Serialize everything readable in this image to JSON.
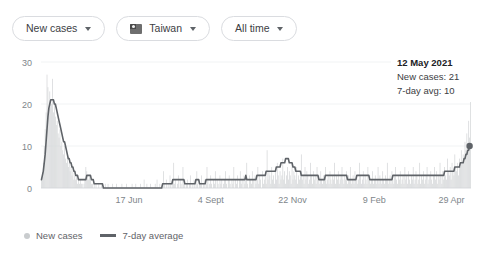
{
  "toolbar": {
    "metric_chip": {
      "label": "New cases",
      "icon": "chevron-down-icon"
    },
    "region_chip": {
      "label": "Taiwan",
      "icon": "taiwan-flag-icon",
      "caret": "chevron-down-icon"
    },
    "range_chip": {
      "label": "All time",
      "icon": "chevron-down-icon"
    }
  },
  "tooltip": {
    "date": "12 May 2021",
    "new_cases": "New cases: 21",
    "avg": "7-day avg: 10"
  },
  "legend": [
    {
      "label": "New cases",
      "marker": "dot",
      "color": "#c9ccce"
    },
    {
      "label": "7-day average",
      "marker": "line",
      "color": "#5f6368"
    }
  ],
  "colors": {
    "bars": "#d3d5d7",
    "line": "#5f6368",
    "grid": "#f1f3f4",
    "axis_text": "#80868b",
    "chip_border": "#dadce0"
  },
  "chart_data": {
    "type": "bar",
    "title": "",
    "xlabel": "",
    "ylabel": "",
    "ylim": [
      0,
      30
    ],
    "yticks": [
      0,
      10,
      20,
      30
    ],
    "grid": true,
    "legend_position": "bottom-left",
    "xticks": [
      "17 Jun",
      "4 Sept",
      "22 Nov",
      "9 Feb",
      "29 Apr"
    ],
    "xtick_positions": [
      0.205,
      0.395,
      0.585,
      0.775,
      0.955
    ],
    "series": [
      {
        "name": "New cases",
        "type": "bar",
        "values": [
          2,
          4,
          6,
          10,
          14,
          18,
          27,
          24,
          19,
          23,
          21,
          20,
          26,
          18,
          20,
          17,
          15,
          16,
          13,
          12,
          14,
          10,
          11,
          9,
          8,
          10,
          7,
          6,
          8,
          5,
          6,
          4,
          5,
          3,
          4,
          2,
          3,
          2,
          3,
          1,
          2,
          1,
          2,
          1,
          1,
          0,
          1,
          2,
          5,
          4,
          3,
          2,
          3,
          2,
          1,
          1,
          0,
          1,
          0,
          1,
          0,
          0,
          1,
          0,
          0,
          1,
          0,
          0,
          0,
          1,
          0,
          0,
          1,
          0,
          0,
          0,
          0,
          1,
          0,
          0,
          0,
          1,
          0,
          0,
          0,
          0,
          0,
          1,
          0,
          0,
          0,
          0,
          1,
          0,
          0,
          0,
          0,
          0,
          1,
          0,
          0,
          0,
          1,
          0,
          0,
          0,
          0,
          1,
          0,
          0,
          0,
          2,
          0,
          0,
          1,
          0,
          0,
          0,
          1,
          0,
          0,
          0,
          0,
          1,
          0,
          2,
          0,
          0,
          1,
          0,
          0,
          0,
          4,
          1,
          0,
          2,
          0,
          1,
          0,
          3,
          1,
          0,
          2,
          6,
          1,
          2,
          0,
          1,
          3,
          0,
          2,
          1,
          0,
          5,
          1,
          2,
          0,
          1,
          2,
          0,
          1,
          3,
          0,
          1,
          0,
          2,
          1,
          0,
          4,
          1,
          0,
          2,
          1,
          3,
          0,
          1,
          2,
          0,
          1,
          5,
          2,
          0,
          1,
          3,
          1,
          0,
          2,
          1,
          4,
          0,
          2,
          1,
          0,
          3,
          1,
          2,
          0,
          1,
          2,
          4,
          1,
          0,
          2,
          3,
          1,
          0,
          2,
          1,
          5,
          0,
          2,
          1,
          3,
          0,
          2,
          4,
          1,
          2,
          0,
          3,
          1,
          2,
          6,
          1,
          0,
          3,
          2,
          1,
          4,
          2,
          0,
          3,
          1,
          2,
          5,
          1,
          3,
          2,
          0,
          4,
          1,
          2,
          3,
          1,
          9,
          2,
          4,
          3,
          1,
          5,
          2,
          3,
          1,
          4,
          2,
          6,
          3,
          1,
          4,
          2,
          3,
          7,
          2,
          4,
          1,
          3,
          5,
          2,
          4,
          3,
          1,
          6,
          2,
          4,
          3,
          2,
          5,
          1,
          3,
          2,
          4,
          8,
          2,
          3,
          1,
          5,
          2,
          4,
          3,
          1,
          2,
          6,
          3,
          1,
          4,
          2,
          3,
          1,
          5,
          2,
          3,
          1,
          4,
          2,
          1,
          3,
          2,
          5,
          1,
          2,
          3,
          1,
          4,
          2,
          1,
          3,
          2,
          6,
          1,
          3,
          2,
          4,
          1,
          2,
          3,
          5,
          2,
          1,
          3,
          2,
          4,
          1,
          3,
          2,
          5,
          1,
          2,
          3,
          1,
          4,
          2,
          3,
          1,
          2,
          6,
          3,
          1,
          2,
          4,
          1,
          3,
          2,
          1,
          5,
          2,
          3,
          1,
          2,
          4,
          1,
          2,
          3,
          1,
          2,
          5,
          1,
          3,
          2,
          1,
          4,
          2,
          1,
          3,
          2,
          6,
          1,
          2,
          3,
          1,
          4,
          2,
          1,
          3,
          5,
          2,
          1,
          3,
          2,
          4,
          1,
          2,
          3,
          1,
          5,
          2,
          3,
          1,
          4,
          2,
          1,
          3,
          2,
          5,
          1,
          2,
          4,
          3,
          1,
          2,
          6,
          1,
          3,
          2,
          4,
          1,
          2,
          3,
          5,
          1,
          2,
          3,
          4,
          2,
          1,
          3,
          5,
          2,
          4,
          1,
          3,
          2,
          6,
          3,
          1,
          4,
          2,
          5,
          3,
          2,
          7,
          4,
          3,
          5,
          2,
          6,
          4,
          3,
          8,
          5,
          4,
          6,
          3,
          7,
          5,
          9,
          6,
          8,
          7,
          11,
          9,
          13,
          10,
          16,
          12,
          21
        ]
      },
      {
        "name": "7-day average",
        "type": "line",
        "values": [
          2,
          3,
          4,
          6,
          8,
          11,
          14,
          17,
          19,
          20,
          21,
          21,
          21,
          21,
          20,
          20,
          19,
          18,
          17,
          16,
          15,
          14,
          13,
          12,
          11,
          11,
          10,
          9,
          8,
          7,
          7,
          6,
          6,
          5,
          5,
          4,
          4,
          3,
          3,
          3,
          2,
          2,
          2,
          2,
          2,
          2,
          2,
          2,
          2,
          3,
          3,
          3,
          3,
          3,
          2,
          2,
          2,
          1,
          1,
          1,
          1,
          1,
          1,
          1,
          1,
          1,
          1,
          0,
          0,
          0,
          0,
          0,
          0,
          0,
          0,
          0,
          0,
          0,
          0,
          0,
          0,
          0,
          0,
          0,
          0,
          0,
          0,
          0,
          0,
          0,
          0,
          0,
          0,
          0,
          0,
          0,
          0,
          0,
          0,
          0,
          0,
          0,
          0,
          0,
          0,
          0,
          0,
          0,
          0,
          0,
          0,
          0,
          0,
          0,
          0,
          0,
          0,
          0,
          0,
          0,
          0,
          0,
          0,
          0,
          0,
          0,
          0,
          0,
          0,
          0,
          0,
          1,
          1,
          1,
          1,
          1,
          1,
          1,
          1,
          1,
          1,
          1,
          2,
          2,
          2,
          2,
          2,
          2,
          2,
          2,
          2,
          2,
          2,
          2,
          2,
          1,
          1,
          1,
          1,
          1,
          1,
          1,
          1,
          1,
          1,
          1,
          1,
          2,
          2,
          2,
          2,
          1,
          1,
          1,
          1,
          1,
          1,
          1,
          2,
          2,
          2,
          2,
          2,
          2,
          2,
          2,
          2,
          2,
          2,
          2,
          2,
          2,
          2,
          2,
          2,
          2,
          2,
          2,
          2,
          2,
          2,
          2,
          2,
          2,
          2,
          2,
          2,
          2,
          2,
          2,
          2,
          2,
          2,
          2,
          2,
          2,
          2,
          2,
          2,
          2,
          2,
          3,
          2,
          2,
          2,
          2,
          2,
          2,
          2,
          2,
          2,
          2,
          2,
          3,
          3,
          3,
          3,
          3,
          3,
          3,
          3,
          3,
          3,
          4,
          4,
          4,
          4,
          4,
          4,
          4,
          4,
          4,
          4,
          4,
          5,
          5,
          5,
          5,
          5,
          6,
          6,
          6,
          6,
          6,
          7,
          7,
          7,
          7,
          6,
          6,
          6,
          6,
          5,
          5,
          5,
          4,
          4,
          4,
          4,
          4,
          4,
          3,
          3,
          3,
          3,
          3,
          3,
          3,
          3,
          3,
          3,
          3,
          3,
          3,
          3,
          3,
          3,
          3,
          3,
          3,
          2,
          2,
          2,
          2,
          2,
          2,
          2,
          3,
          3,
          3,
          3,
          3,
          3,
          3,
          3,
          3,
          3,
          3,
          3,
          3,
          3,
          3,
          3,
          3,
          3,
          3,
          3,
          3,
          3,
          3,
          3,
          2,
          2,
          2,
          2,
          2,
          2,
          2,
          2,
          2,
          2,
          3,
          3,
          3,
          3,
          3,
          3,
          3,
          3,
          3,
          3,
          3,
          3,
          3,
          3,
          2,
          2,
          2,
          2,
          2,
          2,
          2,
          2,
          2,
          2,
          2,
          2,
          2,
          2,
          2,
          2,
          2,
          2,
          2,
          2,
          2,
          2,
          2,
          2,
          2,
          3,
          3,
          3,
          3,
          3,
          3,
          3,
          3,
          3,
          3,
          3,
          3,
          3,
          3,
          3,
          3,
          3,
          3,
          3,
          3,
          3,
          3,
          3,
          3,
          3,
          3,
          3,
          3,
          3,
          3,
          3,
          3,
          3,
          3,
          3,
          3,
          3,
          3,
          3,
          3,
          3,
          3,
          3,
          3,
          3,
          3,
          3,
          3,
          3,
          3,
          3,
          3,
          3,
          3,
          3,
          3,
          4,
          4,
          4,
          4,
          4,
          4,
          4,
          4,
          4,
          4,
          4,
          5,
          5,
          5,
          5,
          5,
          5,
          6,
          6,
          6,
          6,
          7,
          7,
          8,
          8,
          9,
          9,
          10
        ]
      }
    ],
    "highlight_point": {
      "value": 10,
      "label": "12 May 2021"
    }
  }
}
